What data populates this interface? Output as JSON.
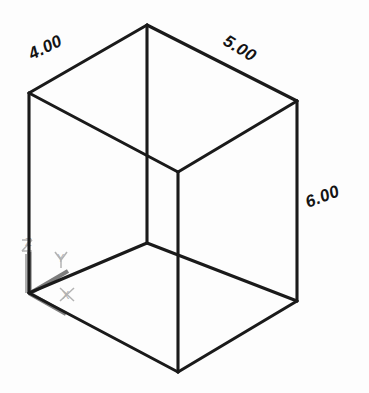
{
  "drawing": {
    "title": "Isometric Box",
    "background_color": "#fdfdfd",
    "line_color": "#1a1a1a",
    "ucs_color": "#7d7d7d",
    "ucs_label_color": "#b0b0b0",
    "dimensions": [
      {
        "id": "width-dimension",
        "value": "4.00",
        "edge": "top-left",
        "x": 52,
        "y": 52,
        "rotation": -25
      },
      {
        "id": "depth-dimension",
        "value": "5.00",
        "edge": "top-right",
        "x": 228,
        "y": 48,
        "rotation": 31
      },
      {
        "id": "height-dimension",
        "value": "6.00",
        "edge": "right-vertical",
        "x": 310,
        "y": 206,
        "rotation": -20
      }
    ],
    "ucs": {
      "name": "ucs-axis-indicator",
      "origin_x": 29,
      "origin_y": 293,
      "axes": [
        {
          "id": "z-axis",
          "label": "Z",
          "label_x": 25,
          "label_y": 246
        },
        {
          "id": "y-axis",
          "label": "Y",
          "label_x": 57,
          "label_y": 262
        },
        {
          "id": "x-axis",
          "label": "X",
          "label_x": 62,
          "label_y": 299
        }
      ]
    },
    "geometry": {
      "vertices": {
        "top_rear": [
          147,
          25
        ],
        "top_left": [
          29,
          93
        ],
        "top_right": [
          297,
          101
        ],
        "top_front": [
          178,
          172
        ],
        "bottom_rear": [
          147,
          243
        ],
        "bottom_left": [
          29,
          293
        ],
        "bottom_right": [
          297,
          301
        ],
        "bottom_front": [
          178,
          372
        ]
      },
      "edges": [
        {
          "id": "edge-top-left-back",
          "from": "top_left",
          "to": "top_rear"
        },
        {
          "id": "edge-top-right-back",
          "from": "top_rear",
          "to": "top_right"
        },
        {
          "id": "edge-top-left-front",
          "from": "top_left",
          "to": "top_front"
        },
        {
          "id": "edge-top-right-front",
          "from": "top_front",
          "to": "top_right"
        },
        {
          "id": "edge-vertical-left",
          "from": "top_left",
          "to": "bottom_left"
        },
        {
          "id": "edge-vertical-right",
          "from": "top_right",
          "to": "bottom_right"
        },
        {
          "id": "edge-vertical-front",
          "from": "top_front",
          "to": "bottom_front"
        },
        {
          "id": "edge-vertical-rear",
          "from": "top_rear",
          "to": "bottom_rear"
        },
        {
          "id": "edge-bottom-left-back",
          "from": "bottom_left",
          "to": "bottom_rear"
        },
        {
          "id": "edge-bottom-right-back",
          "from": "bottom_rear",
          "to": "bottom_right"
        },
        {
          "id": "edge-bottom-left-front",
          "from": "bottom_left",
          "to": "bottom_front"
        },
        {
          "id": "edge-bottom-right-front",
          "from": "bottom_front",
          "to": "bottom_right"
        }
      ]
    }
  }
}
